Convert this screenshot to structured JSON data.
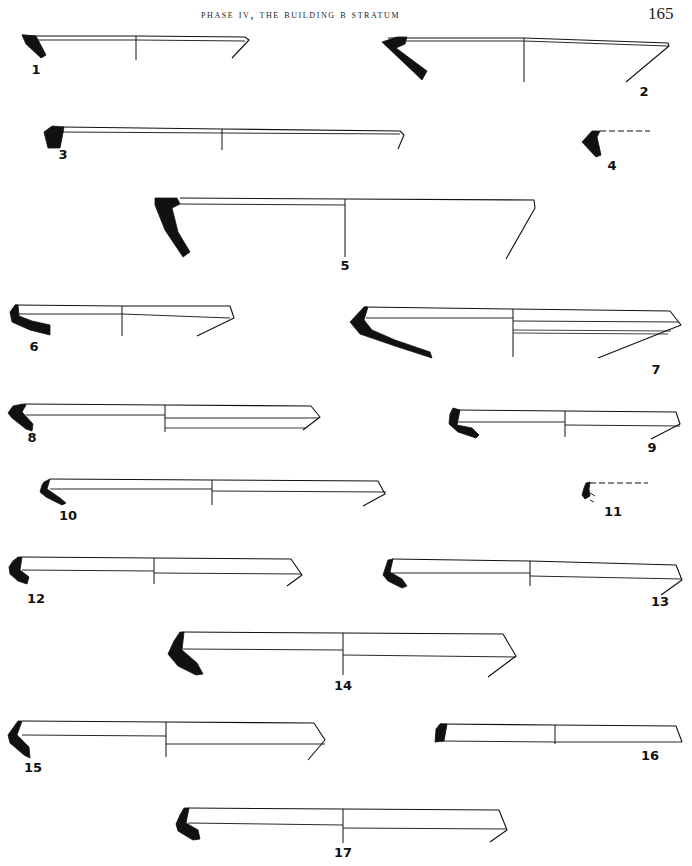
{
  "header": {
    "title": "PHASE IV, THE BUILDING B STRATUM",
    "page_number": "165"
  },
  "figures": [
    {
      "id": "1",
      "label": "1",
      "label_pos": [
        36,
        74
      ],
      "rim": [
        [
          22,
          35
        ],
        [
          36,
          36
        ],
        [
          136,
          36
        ],
        [
          245,
          37
        ],
        [
          249,
          40
        ],
        [
          232,
          58
        ]
      ],
      "inner": [
        [
          36,
          40
        ],
        [
          136,
          40
        ],
        [
          245,
          41
        ]
      ],
      "axis": [
        136,
        36,
        136,
        60
      ],
      "section": [
        [
          22,
          35
        ],
        [
          36,
          36
        ],
        [
          46,
          55
        ],
        [
          41,
          58
        ],
        [
          26,
          44
        ]
      ]
    },
    {
      "id": "2",
      "label": "2",
      "label_pos": [
        644,
        96
      ],
      "rim": [
        [
          388,
          38
        ],
        [
          524,
          38
        ],
        [
          668,
          43
        ],
        [
          669,
          46
        ],
        [
          626,
          82
        ]
      ],
      "inner": [
        [
          406,
          41
        ],
        [
          524,
          41
        ],
        [
          668,
          46
        ]
      ],
      "axis": [
        524,
        38,
        524,
        82
      ],
      "section": [
        [
          382,
          42
        ],
        [
          397,
          37
        ],
        [
          407,
          37
        ],
        [
          405,
          44
        ],
        [
          396,
          48
        ],
        [
          427,
          71
        ],
        [
          422,
          80
        ]
      ]
    },
    {
      "id": "3",
      "label": "3",
      "label_pos": [
        63,
        159
      ],
      "rim": [
        [
          62,
          127
        ],
        [
          222,
          129
        ],
        [
          400,
          131
        ],
        [
          404,
          135
        ],
        [
          398,
          149
        ]
      ],
      "inner": [
        [
          62,
          132
        ],
        [
          222,
          133
        ],
        [
          400,
          134
        ]
      ],
      "axis": [
        222,
        129,
        222,
        150
      ],
      "section": [
        [
          44,
          132
        ],
        [
          52,
          126
        ],
        [
          64,
          127
        ],
        [
          62,
          138
        ],
        [
          60,
          148
        ],
        [
          48,
          148
        ]
      ]
    },
    {
      "id": "4",
      "label": "4",
      "label_pos": [
        612,
        170
      ],
      "rim": [],
      "inner": [],
      "dashed": [
        [
          600,
          131
        ],
        [
          650,
          131
        ]
      ],
      "axis": null,
      "section": [
        [
          582,
          142
        ],
        [
          592,
          131
        ],
        [
          600,
          131
        ],
        [
          597,
          137
        ],
        [
          601,
          155
        ],
        [
          596,
          157
        ]
      ]
    },
    {
      "id": "5",
      "label": "5",
      "label_pos": [
        345,
        270
      ],
      "rim": [
        [
          180,
          198
        ],
        [
          345,
          199
        ],
        [
          534,
          200
        ],
        [
          535,
          208
        ],
        [
          506,
          259
        ]
      ],
      "inner": [
        [
          180,
          204
        ],
        [
          345,
          205
        ]
      ],
      "axis": [
        345,
        199,
        345,
        257
      ],
      "section": [
        [
          155,
          198
        ],
        [
          177,
          198
        ],
        [
          180,
          204
        ],
        [
          172,
          208
        ],
        [
          178,
          232
        ],
        [
          190,
          252
        ],
        [
          183,
          257
        ],
        [
          165,
          230
        ],
        [
          155,
          205
        ]
      ]
    },
    {
      "id": "6",
      "label": "6",
      "label_pos": [
        34,
        351
      ],
      "rim": [
        [
          15,
          305
        ],
        [
          122,
          306
        ],
        [
          230,
          306
        ],
        [
          234,
          318
        ],
        [
          197,
          336
        ]
      ],
      "inner": [
        [
          17,
          314
        ],
        [
          122,
          314
        ],
        [
          230,
          318
        ]
      ],
      "axis": [
        122,
        306,
        122,
        336
      ],
      "section": [
        [
          15,
          305
        ],
        [
          18,
          305
        ],
        [
          19,
          316
        ],
        [
          32,
          321
        ],
        [
          50,
          325
        ],
        [
          50,
          335
        ],
        [
          30,
          330
        ],
        [
          12,
          322
        ],
        [
          10,
          312
        ]
      ]
    },
    {
      "id": "7",
      "label": "7",
      "label_pos": [
        656,
        374
      ],
      "rim": [
        [
          364,
          307
        ],
        [
          513,
          309
        ],
        [
          670,
          311
        ],
        [
          681,
          325
        ],
        [
          598,
          358
        ]
      ],
      "inner": [
        [
          366,
          318
        ],
        [
          513,
          318
        ]
      ],
      "inner2": [
        [
          513,
          321
        ],
        [
          679,
          322
        ]
      ],
      "inner3": [
        [
          513,
          330
        ],
        [
          671,
          331
        ],
        [
          513,
          333
        ],
        [
          668,
          334
        ]
      ],
      "axis": [
        513,
        309,
        513,
        357
      ],
      "section": [
        [
          364,
          307
        ],
        [
          368,
          307
        ],
        [
          364,
          320
        ],
        [
          372,
          330
        ],
        [
          395,
          340
        ],
        [
          430,
          352
        ],
        [
          432,
          358
        ],
        [
          395,
          346
        ],
        [
          360,
          334
        ],
        [
          350,
          322
        ]
      ]
    },
    {
      "id": "8",
      "label": "8",
      "label_pos": [
        32,
        442
      ],
      "rim": [
        [
          24,
          404
        ],
        [
          165,
          405
        ],
        [
          311,
          406
        ],
        [
          320,
          417
        ],
        [
          303,
          430
        ]
      ],
      "inner": [
        [
          26,
          415
        ],
        [
          165,
          415
        ]
      ],
      "inner2": [
        [
          165,
          418
        ],
        [
          319,
          418
        ]
      ],
      "inner3": [
        [
          165,
          428
        ],
        [
          306,
          428
        ]
      ],
      "axis": [
        165,
        405,
        165,
        432
      ],
      "section": [
        [
          23,
          404
        ],
        [
          26,
          405
        ],
        [
          22,
          412
        ],
        [
          33,
          424
        ],
        [
          32,
          431
        ],
        [
          26,
          429
        ],
        [
          12,
          418
        ],
        [
          8,
          413
        ],
        [
          13,
          406
        ]
      ]
    },
    {
      "id": "9",
      "label": "9",
      "label_pos": [
        652,
        452
      ],
      "rim": [
        [
          458,
          410
        ],
        [
          565,
          411
        ],
        [
          676,
          412
        ],
        [
          680,
          424
        ],
        [
          651,
          439
        ]
      ],
      "inner": [
        [
          458,
          422
        ],
        [
          565,
          422
        ]
      ],
      "inner2": [
        [
          565,
          425
        ],
        [
          680,
          426
        ]
      ],
      "axis": [
        565,
        411,
        565,
        437
      ],
      "section": [
        [
          453,
          408
        ],
        [
          460,
          410
        ],
        [
          457,
          425
        ],
        [
          472,
          428
        ],
        [
          479,
          435
        ],
        [
          476,
          438
        ],
        [
          458,
          432
        ],
        [
          449,
          424
        ],
        [
          450,
          414
        ]
      ]
    },
    {
      "id": "10",
      "label": "10",
      "label_pos": [
        68,
        520
      ],
      "rim": [
        [
          50,
          479
        ],
        [
          212,
          480
        ],
        [
          378,
          481
        ],
        [
          385,
          494
        ],
        [
          363,
          506
        ]
      ],
      "inner": [
        [
          50,
          489
        ],
        [
          212,
          489
        ]
      ],
      "inner2": [
        [
          212,
          491
        ],
        [
          386,
          492
        ]
      ],
      "axis": [
        212,
        480,
        212,
        505
      ],
      "section": [
        [
          44,
          482
        ],
        [
          50,
          479
        ],
        [
          47,
          489
        ],
        [
          60,
          498
        ],
        [
          66,
          503
        ],
        [
          62,
          505
        ],
        [
          46,
          497
        ],
        [
          40,
          492
        ],
        [
          42,
          485
        ]
      ]
    },
    {
      "id": "11",
      "label": "11",
      "label_pos": [
        613,
        516
      ],
      "rim": [],
      "inner": [],
      "dashed": [
        [
          590,
          483
        ],
        [
          648,
          483
        ]
      ],
      "axis": null,
      "section": [
        [
          584,
          488
        ],
        [
          586,
          483
        ],
        [
          590,
          482
        ],
        [
          589,
          489
        ],
        [
          590,
          496
        ],
        [
          585,
          499
        ],
        [
          582,
          495
        ]
      ],
      "tick": [
        [
          590,
          493
        ],
        [
          595,
          496
        ],
        [
          590,
          500
        ],
        [
          594,
          502
        ]
      ]
    },
    {
      "id": "12",
      "label": "12",
      "label_pos": [
        36,
        603
      ],
      "rim": [
        [
          22,
          557
        ],
        [
          154,
          558
        ],
        [
          291,
          559
        ],
        [
          302,
          575
        ],
        [
          287,
          586
        ]
      ],
      "inner": [
        [
          22,
          570
        ],
        [
          154,
          571
        ]
      ],
      "inner2": [
        [
          154,
          573
        ],
        [
          302,
          574
        ]
      ],
      "axis": [
        154,
        558,
        154,
        584
      ],
      "section": [
        [
          18,
          557
        ],
        [
          22,
          557
        ],
        [
          20,
          570
        ],
        [
          29,
          577
        ],
        [
          27,
          584
        ],
        [
          18,
          581
        ],
        [
          10,
          574
        ],
        [
          9,
          567
        ],
        [
          13,
          561
        ]
      ]
    },
    {
      "id": "13",
      "label": "13",
      "label_pos": [
        660,
        606
      ],
      "rim": [
        [
          392,
          559
        ],
        [
          530,
          561
        ],
        [
          676,
          565
        ],
        [
          682,
          580
        ],
        [
          661,
          595
        ]
      ],
      "inner": [
        [
          392,
          573
        ],
        [
          530,
          573
        ]
      ],
      "inner2": [
        [
          530,
          576
        ],
        [
          682,
          579
        ]
      ],
      "axis": [
        530,
        561,
        530,
        586
      ],
      "section": [
        [
          388,
          560
        ],
        [
          393,
          559
        ],
        [
          390,
          572
        ],
        [
          402,
          579
        ],
        [
          407,
          586
        ],
        [
          402,
          588
        ],
        [
          388,
          581
        ],
        [
          383,
          575
        ],
        [
          386,
          566
        ]
      ]
    },
    {
      "id": "14",
      "label": "14",
      "label_pos": [
        343,
        690
      ],
      "rim": [
        [
          183,
          632
        ],
        [
          343,
          633
        ],
        [
          503,
          634
        ],
        [
          516,
          656
        ],
        [
          488,
          677
        ]
      ],
      "inner": [
        [
          183,
          649
        ],
        [
          343,
          650
        ]
      ],
      "inner2": [
        [
          343,
          655
        ],
        [
          516,
          657
        ]
      ],
      "axis": [
        343,
        633,
        343,
        675
      ],
      "section": [
        [
          180,
          632
        ],
        [
          184,
          632
        ],
        [
          182,
          650
        ],
        [
          197,
          663
        ],
        [
          203,
          674
        ],
        [
          196,
          675
        ],
        [
          178,
          666
        ],
        [
          168,
          654
        ],
        [
          174,
          641
        ]
      ]
    },
    {
      "id": "15",
      "label": "15",
      "label_pos": [
        33,
        772
      ],
      "rim": [
        [
          22,
          721
        ],
        [
          166,
          722
        ],
        [
          314,
          723
        ],
        [
          325,
          740
        ],
        [
          308,
          760
        ]
      ],
      "inner": [
        [
          22,
          735
        ],
        [
          166,
          736
        ]
      ],
      "inner2": [
        [
          166,
          744
        ],
        [
          325,
          744
        ]
      ],
      "axis": [
        166,
        722,
        166,
        757
      ],
      "section": [
        [
          18,
          721
        ],
        [
          22,
          721
        ],
        [
          17,
          735
        ],
        [
          29,
          747
        ],
        [
          30,
          758
        ],
        [
          24,
          755
        ],
        [
          10,
          743
        ],
        [
          8,
          735
        ],
        [
          13,
          728
        ]
      ]
    },
    {
      "id": "16",
      "label": "16",
      "label_pos": [
        650,
        760
      ],
      "rim": [
        [
          440,
          724
        ],
        [
          555,
          725
        ],
        [
          676,
          726
        ],
        [
          682,
          742
        ]
      ],
      "inner": [
        [
          440,
          741
        ],
        [
          555,
          742
        ],
        [
          682,
          742
        ]
      ],
      "axis": [
        555,
        725,
        555,
        744
      ],
      "section": [
        [
          436,
          729
        ],
        [
          440,
          724
        ],
        [
          447,
          724
        ],
        [
          444,
          741
        ],
        [
          435,
          742
        ]
      ]
    },
    {
      "id": "17",
      "label": "17",
      "label_pos": [
        343,
        857
      ],
      "rim": [
        [
          188,
          808
        ],
        [
          343,
          809
        ],
        [
          499,
          810
        ],
        [
          507,
          830
        ],
        [
          490,
          842
        ]
      ],
      "inner": [
        [
          188,
          823
        ],
        [
          343,
          825
        ]
      ],
      "inner2": [
        [
          343,
          828
        ],
        [
          507,
          829
        ]
      ],
      "axis": [
        343,
        809,
        343,
        843
      ],
      "section": [
        [
          184,
          808
        ],
        [
          189,
          808
        ],
        [
          186,
          823
        ],
        [
          198,
          830
        ],
        [
          200,
          839
        ],
        [
          193,
          840
        ],
        [
          178,
          831
        ],
        [
          176,
          824
        ],
        [
          180,
          815
        ]
      ]
    }
  ],
  "colors": {
    "ink": "#111111",
    "paper": "#ffffff"
  }
}
